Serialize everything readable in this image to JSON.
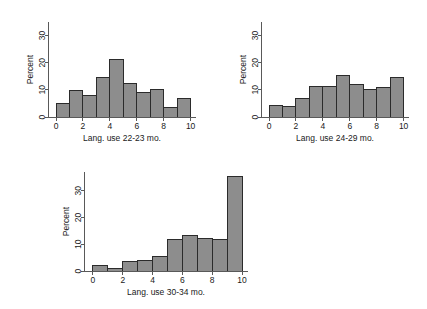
{
  "figure": {
    "background_color": "#ffffff",
    "bar_fill_color": "#8d8d8d",
    "bar_edge_color": "#2b2b2b",
    "axis_color": "#595959"
  },
  "chart_data": [
    {
      "type": "bar",
      "title": "",
      "xlabel": "Lang. use 22-23 mo.",
      "ylabel": "Percent",
      "xlim": [
        -0.6,
        10.4
      ],
      "ylim": [
        0,
        35
      ],
      "xticks": [
        0,
        2,
        4,
        6,
        8,
        10
      ],
      "xtick_labels": [
        "0",
        "2",
        "4",
        "6",
        "8",
        "10"
      ],
      "yticks": [
        0,
        10,
        20,
        30
      ],
      "ytick_labels": [
        "0",
        "10",
        "20",
        "30"
      ],
      "grid": false,
      "legend": "none",
      "bin_edges": [
        0,
        1,
        2,
        3,
        4,
        5,
        6,
        7,
        8,
        9,
        10
      ],
      "categories": [
        "0-1",
        "1-2",
        "2-3",
        "3-4",
        "4-5",
        "5-6",
        "6-7",
        "7-8",
        "8-9",
        "9-10"
      ],
      "values": [
        5.0,
        9.6,
        8.0,
        14.6,
        21.2,
        12.4,
        9.2,
        10.3,
        3.4,
        6.9
      ]
    },
    {
      "type": "bar",
      "title": "",
      "xlabel": "Lang. use 24-29 mo.",
      "ylabel": "Percent",
      "xlim": [
        -0.6,
        10.4
      ],
      "ylim": [
        0,
        35
      ],
      "xticks": [
        0,
        2,
        4,
        6,
        8,
        10
      ],
      "xtick_labels": [
        "0",
        "2",
        "4",
        "6",
        "8",
        "10"
      ],
      "yticks": [
        0,
        10,
        20,
        30
      ],
      "ytick_labels": [
        "0",
        "10",
        "20",
        "30"
      ],
      "grid": false,
      "legend": "none",
      "bin_edges": [
        0,
        1,
        2,
        3,
        4,
        5,
        6,
        7,
        8,
        9,
        10
      ],
      "categories": [
        "0-1",
        "1-2",
        "2-3",
        "3-4",
        "4-5",
        "5-6",
        "6-7",
        "7-8",
        "8-9",
        "9-10"
      ],
      "values": [
        4.1,
        3.9,
        6.8,
        11.1,
        11.3,
        15.3,
        12.0,
        10.3,
        10.9,
        14.7
      ]
    },
    {
      "type": "bar",
      "title": "",
      "xlabel": "Lang. use 30-34 mo.",
      "ylabel": "Percent",
      "xlim": [
        -0.6,
        10.4
      ],
      "ylim": [
        0,
        37
      ],
      "xticks": [
        0,
        2,
        4,
        6,
        8,
        10
      ],
      "xtick_labels": [
        "0",
        "2",
        "4",
        "6",
        "8",
        "10"
      ],
      "yticks": [
        0,
        10,
        20,
        30
      ],
      "ytick_labels": [
        "0",
        "10",
        "20",
        "30"
      ],
      "grid": false,
      "legend": "none",
      "bin_edges": [
        0,
        1,
        2,
        3,
        4,
        5,
        6,
        7,
        8,
        9,
        10
      ],
      "categories": [
        "0-1",
        "1-2",
        "2-3",
        "3-4",
        "4-5",
        "5-6",
        "6-7",
        "7-8",
        "8-9",
        "9-10"
      ],
      "values": [
        2.2,
        0.8,
        3.4,
        3.9,
        5.5,
        11.8,
        13.4,
        12.3,
        11.8,
        35.5
      ]
    }
  ]
}
